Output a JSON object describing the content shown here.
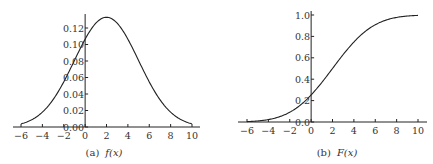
{
  "chart_data": [
    {
      "type": "line",
      "title": "",
      "caption": "(a) f(x)",
      "caption_label": "(a)",
      "caption_func": "f(x)",
      "xlabel": "",
      "ylabel": "",
      "xlim": [
        -6,
        10
      ],
      "ylim": [
        0,
        0.133
      ],
      "grid": false,
      "x_ticks": [
        "−6",
        "−4",
        "−2",
        "0",
        "2",
        "4",
        "6",
        "8",
        "10"
      ],
      "y_ticks": [
        "0.00",
        "0.02",
        "0.04",
        "0.06",
        "0.08",
        "0.10",
        "0.12"
      ],
      "series": [
        {
          "name": "f(x)",
          "description": "normal density, mean 2, sd 3",
          "x": [
            -6,
            -5,
            -4,
            -3,
            -2,
            -1,
            0,
            1,
            2,
            3,
            4,
            5,
            6,
            7,
            8,
            9,
            10
          ],
          "values": [
            0.0038,
            0.0087,
            0.018,
            0.033,
            0.055,
            0.081,
            0.106,
            0.126,
            0.133,
            0.126,
            0.106,
            0.081,
            0.055,
            0.033,
            0.018,
            0.0087,
            0.0038
          ]
        }
      ]
    },
    {
      "type": "line",
      "title": "",
      "caption": "(b) F(x)",
      "caption_label": "(b)",
      "caption_func": "F(x)",
      "xlabel": "",
      "ylabel": "",
      "xlim": [
        -6,
        10
      ],
      "ylim": [
        0,
        1.0
      ],
      "grid": false,
      "x_ticks": [
        "−6",
        "−4",
        "−2",
        "0",
        "2",
        "4",
        "6",
        "8",
        "10"
      ],
      "y_ticks": [
        "0.0",
        "0.2",
        "0.4",
        "0.6",
        "0.8",
        "1.0"
      ],
      "series": [
        {
          "name": "F(x)",
          "description": "normal CDF, mean 2, sd 3",
          "x": [
            -6,
            -5,
            -4,
            -3,
            -2,
            -1,
            0,
            1,
            2,
            3,
            4,
            5,
            6,
            7,
            8,
            9,
            10
          ],
          "values": [
            0.004,
            0.01,
            0.023,
            0.048,
            0.091,
            0.159,
            0.252,
            0.369,
            0.5,
            0.631,
            0.748,
            0.841,
            0.909,
            0.952,
            0.977,
            0.99,
            0.996
          ]
        }
      ]
    }
  ]
}
